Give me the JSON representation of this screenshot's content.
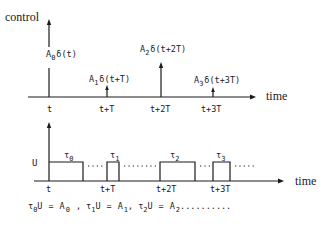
{
  "top_plot": {
    "y_label": "control",
    "x_label": "time",
    "ticks": [
      "t",
      "t+T",
      "t+2T",
      "t+3T"
    ],
    "impulses": [
      {
        "amp": "A",
        "sub": "0",
        "arg": "δ(t)"
      },
      {
        "amp": "A",
        "sub": "1",
        "arg": "δ(t+T)"
      },
      {
        "amp": "A",
        "sub": "2",
        "arg": "δ(t+2T)"
      },
      {
        "amp": "A",
        "sub": "3",
        "arg": "δ(t+3T)"
      }
    ]
  },
  "bottom_plot": {
    "y_level_label": "U",
    "x_label": "time",
    "ticks": [
      "t",
      "t+T",
      "t+2T",
      "t+3T"
    ],
    "pulses": [
      {
        "sym": "τ",
        "sub": "0"
      },
      {
        "sym": "τ",
        "sub": "1"
      },
      {
        "sym": "τ",
        "sub": "2"
      },
      {
        "sym": "τ",
        "sub": "3"
      }
    ]
  },
  "equation": {
    "terms": [
      {
        "tau": "τ",
        "tau_sub": "0",
        "u": "U",
        "eq": "=",
        "a": "A",
        "a_sub": "0",
        "sep": ","
      },
      {
        "tau": "τ",
        "tau_sub": "1",
        "u": "U",
        "eq": "=",
        "a": "A",
        "a_sub": "1",
        "sep": ","
      },
      {
        "tau": "τ",
        "tau_sub": "2",
        "u": "U",
        "eq": "=",
        "a": "A",
        "a_sub": "2",
        "sep": ".........."
      }
    ]
  }
}
